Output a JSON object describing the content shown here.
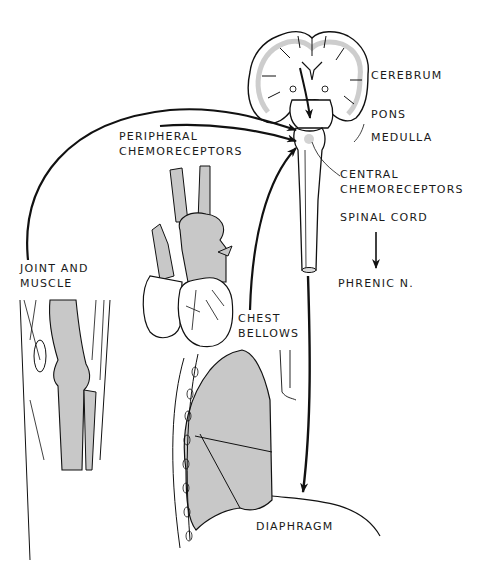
{
  "diagram": {
    "colors": {
      "line": "#111111",
      "fill": "#c8c8c8",
      "background": "#ffffff"
    },
    "labels": {
      "cerebrum": "CEREBRUM",
      "pons": "PONS",
      "medulla": "MEDULLA",
      "central_chemo_1": "CENTRAL",
      "central_chemo_2": "CHEMORECEPTORS",
      "peripheral_chemo_1": "PERIPHERAL",
      "peripheral_chemo_2": "CHEMORECEPTORS",
      "spinal_cord": "SPINAL CORD",
      "phrenic": "PHRENIC N.",
      "joint_1": "JOINT AND",
      "joint_2": "MUSCLE",
      "chest_1": "CHEST",
      "chest_2": "BELLOWS",
      "diaphragm": "DIAPHRAGM"
    },
    "nodes": [
      {
        "id": "cerebrum",
        "label": "CEREBRUM"
      },
      {
        "id": "pons",
        "label": "PONS"
      },
      {
        "id": "medulla",
        "label": "MEDULLA"
      },
      {
        "id": "central_chemoreceptors",
        "label": "CENTRAL CHEMORECEPTORS"
      },
      {
        "id": "peripheral_chemoreceptors",
        "label": "PERIPHERAL CHEMORECEPTORS"
      },
      {
        "id": "joint_muscle",
        "label": "JOINT AND MUSCLE"
      },
      {
        "id": "chest_bellows",
        "label": "CHEST BELLOWS"
      },
      {
        "id": "spinal_cord",
        "label": "SPINAL CORD"
      },
      {
        "id": "phrenic_nerve",
        "label": "PHRENIC N."
      },
      {
        "id": "diaphragm",
        "label": "DIAPHRAGM"
      }
    ],
    "edges": [
      {
        "from": "cerebrum",
        "to": "medulla"
      },
      {
        "from": "joint_muscle",
        "to": "medulla"
      },
      {
        "from": "peripheral_chemoreceptors",
        "to": "medulla"
      },
      {
        "from": "chest_bellows",
        "to": "medulla"
      },
      {
        "from": "medulla",
        "to": "diaphragm"
      },
      {
        "from": "spinal_cord",
        "to": "phrenic_nerve"
      }
    ]
  }
}
